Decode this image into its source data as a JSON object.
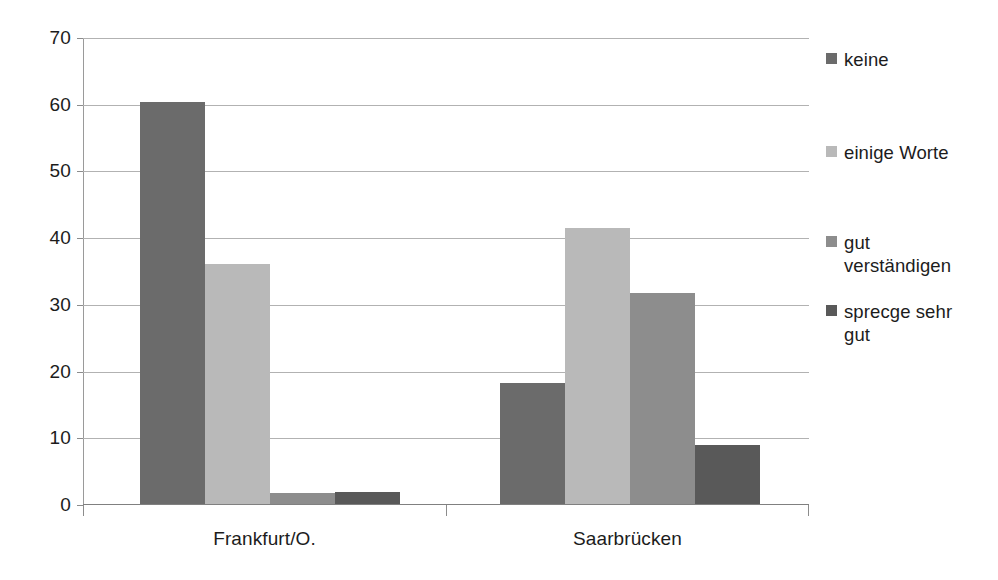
{
  "chart_data": {
    "type": "bar",
    "title": "",
    "subtitle": "",
    "xlabel": "",
    "ylabel": "",
    "categories": [
      "Frankfurt/O.",
      "Saarbrücken"
    ],
    "series": [
      {
        "name": "keine",
        "color": "#6b6b6b",
        "values": [
          60.2,
          18.2
        ]
      },
      {
        "name": "einige Worte",
        "color": "#b9b9b9",
        "values": [
          36.0,
          41.4
        ]
      },
      {
        "name": "gut verständigen",
        "color": "#8d8d8d",
        "values": [
          1.7,
          31.7
        ]
      },
      {
        "name": "sprecge sehr gut",
        "color": "#595959",
        "values": [
          1.8,
          8.8
        ]
      }
    ],
    "ylim": [
      0,
      70
    ],
    "ytick_labels": [
      "0",
      "10",
      "20",
      "30",
      "40",
      "50",
      "60",
      "70"
    ],
    "ytick_values": [
      0,
      10,
      20,
      30,
      40,
      50,
      60,
      70
    ],
    "ytick_step": 10,
    "grid": true,
    "grid_color": "#b2b2b2",
    "legend_position": "right",
    "legend_entries": [
      "keine",
      "einige Worte",
      "gut\nverständigen",
      "sprecge sehr\ngut"
    ],
    "background_color": "#ffffff",
    "axis_color": "#8c8c8c",
    "text_color": "#1c1c1c"
  }
}
